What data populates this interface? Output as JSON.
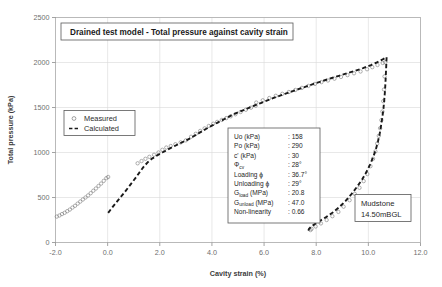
{
  "chart_data": {
    "type": "line",
    "title": "Drained test model - Total pressure against cavity strain",
    "xlabel": "Cavity strain (%)",
    "ylabel": "Total pressure (kPa)",
    "xlim": [
      -2.0,
      12.0
    ],
    "ylim": [
      0,
      2500
    ],
    "xticks": [
      "-2.0",
      "0.0",
      "2.0",
      "4.0",
      "6.0",
      "8.0",
      "10.0",
      "12.0"
    ],
    "yticks": [
      "0",
      "500",
      "1000",
      "1500",
      "2000",
      "2500"
    ],
    "xtick_values": [
      -2.0,
      0.0,
      2.0,
      4.0,
      6.0,
      8.0,
      10.0,
      12.0
    ],
    "ytick_values": [
      0,
      500,
      1000,
      1500,
      2000,
      2500
    ],
    "grid": true,
    "legend_position": "upper-left-inside",
    "series": [
      {
        "name": "Measured",
        "style": "markers",
        "marker": "open-circle",
        "color": "#7a7a7a",
        "points": [
          [
            -1.95,
            288
          ],
          [
            -1.85,
            300
          ],
          [
            -1.75,
            316
          ],
          [
            -1.65,
            330
          ],
          [
            -1.55,
            348
          ],
          [
            -1.45,
            366
          ],
          [
            -1.35,
            388
          ],
          [
            -1.25,
            408
          ],
          [
            -1.15,
            432
          ],
          [
            -1.05,
            455
          ],
          [
            -0.95,
            478
          ],
          [
            -0.85,
            500
          ],
          [
            -0.75,
            523
          ],
          [
            -0.65,
            548
          ],
          [
            -0.55,
            575
          ],
          [
            -0.45,
            600
          ],
          [
            -0.35,
            628
          ],
          [
            -0.25,
            655
          ],
          [
            -0.15,
            685
          ],
          [
            -0.05,
            715
          ],
          [
            0.02,
            728
          ],
          [
            1.15,
            880
          ],
          [
            1.3,
            905
          ],
          [
            1.45,
            930
          ],
          [
            1.6,
            952
          ],
          [
            1.78,
            975
          ],
          [
            1.95,
            1000
          ],
          [
            2.1,
            1030
          ],
          [
            2.25,
            1055
          ],
          [
            2.42,
            1072
          ],
          [
            2.6,
            1092
          ],
          [
            2.8,
            1112
          ],
          [
            3.0,
            1135
          ],
          [
            3.2,
            1175
          ],
          [
            3.38,
            1208
          ],
          [
            3.55,
            1240
          ],
          [
            3.72,
            1268
          ],
          [
            3.88,
            1295
          ],
          [
            4.05,
            1320
          ],
          [
            4.2,
            1340
          ],
          [
            4.38,
            1362
          ],
          [
            4.55,
            1382
          ],
          [
            4.72,
            1402
          ],
          [
            4.9,
            1425
          ],
          [
            5.1,
            1450
          ],
          [
            5.3,
            1475
          ],
          [
            5.5,
            1498
          ],
          [
            5.68,
            1520
          ],
          [
            5.7,
            1555
          ],
          [
            5.95,
            1580
          ],
          [
            6.2,
            1605
          ],
          [
            6.45,
            1630
          ],
          [
            6.7,
            1652
          ],
          [
            6.95,
            1672
          ],
          [
            7.2,
            1695
          ],
          [
            7.45,
            1718
          ],
          [
            7.7,
            1740
          ],
          [
            7.95,
            1762
          ],
          [
            8.2,
            1782
          ],
          [
            8.45,
            1800
          ],
          [
            8.7,
            1820
          ],
          [
            8.95,
            1840
          ],
          [
            9.2,
            1860
          ],
          [
            9.45,
            1880
          ],
          [
            9.7,
            1900
          ],
          [
            9.95,
            1925
          ],
          [
            10.15,
            1948
          ],
          [
            10.35,
            1972
          ],
          [
            10.55,
            1995
          ],
          [
            10.65,
            2002
          ],
          [
            10.62,
            1845
          ],
          [
            10.6,
            1700
          ],
          [
            10.57,
            1570
          ],
          [
            10.54,
            1455
          ],
          [
            10.5,
            1360
          ],
          [
            10.45,
            1270
          ],
          [
            10.4,
            1185
          ],
          [
            10.34,
            1100
          ],
          [
            10.27,
            1012
          ],
          [
            10.18,
            930
          ],
          [
            10.08,
            848
          ],
          [
            9.96,
            760
          ],
          [
            9.82,
            682
          ],
          [
            9.66,
            608
          ],
          [
            9.48,
            540
          ],
          [
            9.28,
            470
          ],
          [
            9.05,
            398
          ],
          [
            8.85,
            340
          ],
          [
            8.62,
            292
          ],
          [
            8.4,
            250
          ],
          [
            8.18,
            212
          ],
          [
            7.98,
            178
          ],
          [
            7.82,
            152
          ],
          [
            7.78,
            138
          ]
        ]
      },
      {
        "name": "Calculated",
        "style": "dashed-line",
        "color": "#1a1a1a",
        "points": [
          [
            0.02,
            330
          ],
          [
            0.12,
            368
          ],
          [
            0.24,
            412
          ],
          [
            0.38,
            462
          ],
          [
            0.52,
            512
          ],
          [
            0.66,
            562
          ],
          [
            0.8,
            615
          ],
          [
            0.95,
            672
          ],
          [
            1.1,
            728
          ],
          [
            1.25,
            790
          ],
          [
            1.4,
            848
          ],
          [
            1.55,
            895
          ],
          [
            1.72,
            935
          ],
          [
            1.9,
            968
          ],
          [
            2.1,
            1000
          ],
          [
            2.3,
            1032
          ],
          [
            2.52,
            1065
          ],
          [
            2.75,
            1098
          ],
          [
            3.0,
            1132
          ],
          [
            3.25,
            1172
          ],
          [
            3.5,
            1215
          ],
          [
            3.75,
            1258
          ],
          [
            4.0,
            1298
          ],
          [
            4.25,
            1338
          ],
          [
            4.5,
            1375
          ],
          [
            4.75,
            1412
          ],
          [
            5.0,
            1445
          ],
          [
            5.3,
            1482
          ],
          [
            5.6,
            1518
          ],
          [
            5.9,
            1552
          ],
          [
            6.2,
            1588
          ],
          [
            6.5,
            1620
          ],
          [
            6.8,
            1652
          ],
          [
            7.1,
            1682
          ],
          [
            7.4,
            1712
          ],
          [
            7.7,
            1742
          ],
          [
            8.0,
            1772
          ],
          [
            8.3,
            1800
          ],
          [
            8.6,
            1828
          ],
          [
            8.9,
            1855
          ],
          [
            9.2,
            1882
          ],
          [
            9.5,
            1908
          ],
          [
            9.8,
            1938
          ],
          [
            10.1,
            1972
          ],
          [
            10.35,
            2005
          ],
          [
            10.55,
            2035
          ],
          [
            10.7,
            2060
          ],
          [
            10.68,
            1925
          ],
          [
            10.66,
            1800
          ],
          [
            10.64,
            1690
          ],
          [
            10.61,
            1585
          ],
          [
            10.58,
            1490
          ],
          [
            10.54,
            1398
          ],
          [
            10.49,
            1305
          ],
          [
            10.44,
            1215
          ],
          [
            10.37,
            1125
          ],
          [
            10.29,
            1038
          ],
          [
            10.19,
            952
          ],
          [
            10.07,
            868
          ],
          [
            9.93,
            785
          ],
          [
            9.76,
            700
          ],
          [
            9.57,
            620
          ],
          [
            9.36,
            540
          ],
          [
            9.12,
            460
          ],
          [
            8.88,
            392
          ],
          [
            8.62,
            330
          ],
          [
            8.38,
            282
          ],
          [
            8.15,
            242
          ],
          [
            7.95,
            205
          ],
          [
            7.8,
            175
          ],
          [
            7.72,
            150
          ],
          [
            7.7,
            132
          ]
        ]
      }
    ]
  },
  "title_box": {
    "text": "Drained test model - Total pressure against cavity strain"
  },
  "legend": {
    "items": [
      {
        "label": "Measured",
        "marker": "open-circle"
      },
      {
        "label": "Calculated",
        "marker": "dashed-line"
      }
    ]
  },
  "param_box": {
    "rows": [
      {
        "label": "Uo (kPa)",
        "sub": "",
        "sep": ":",
        "value": "158"
      },
      {
        "label": "Po (kPa)",
        "sub": "",
        "sep": ":",
        "value": "290"
      },
      {
        "label": "c' (kPa)",
        "sub": "",
        "sep": ":",
        "value": "30"
      },
      {
        "label": "Φ",
        "sub": "cv",
        "sep": ":",
        "value": "28°"
      },
      {
        "label": "Loading ϕ",
        "sub": "",
        "sep": ":",
        "value": "36.7°"
      },
      {
        "label": "Unloading ϕ",
        "sub": "",
        "sep": ":",
        "value": "29°"
      },
      {
        "label": "G",
        "sub": "load",
        "unit": " (MPa)",
        "sep": ":",
        "value": "20.8"
      },
      {
        "label": "G",
        "sub": "unload",
        "unit": " (MPa)",
        "sep": ":",
        "value": "47.0"
      },
      {
        "label": "Non-linearity",
        "sub": "",
        "sep": ":",
        "value": "0.66"
      }
    ]
  },
  "note_box": {
    "line1": "Mudstone",
    "line2": "14.50mBGL"
  },
  "colors": {
    "measured": "#7a7a7a",
    "calculated": "#1a1a1a",
    "grid": "#d9d9d9",
    "frame": "#a6a6a6",
    "text": "#1f1f1f"
  }
}
